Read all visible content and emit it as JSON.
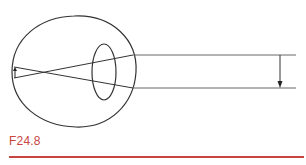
{
  "figure": {
    "label": "F24.8",
    "accent_color": "#c8453f",
    "stroke_color": "#333333",
    "elements": {
      "eyeball": "outline of eye globe",
      "lens": "ellipse lens inside eye",
      "rays": "two parallel incoming rays crossing after lens",
      "object_arrow": "downward arrow at right between rays",
      "image_arrow": "small upward arrow on retina (inverted image)"
    }
  }
}
